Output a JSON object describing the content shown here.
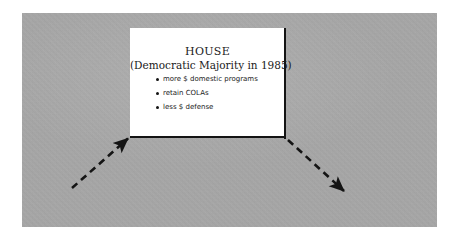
{
  "figure": {
    "panel_background_color": "#a9a9a9",
    "wall_background_color": "#ffffff",
    "line_color": "#141414",
    "text_color": "#1a1a1a"
  },
  "wall": {
    "title": "HOUSE",
    "subtitle": "(Democratic Majority in 1985)",
    "bullets": [
      {
        "text": "more $ domestic programs"
      },
      {
        "text": "retain COLAs"
      },
      {
        "text": "less $ defense"
      }
    ]
  },
  "connectors": [
    {
      "name": "left-dashed-arrow",
      "direction": "up-right",
      "arrowhead_at": "end",
      "start": {
        "x": 72,
        "y": 188
      },
      "end": {
        "x": 130,
        "y": 137
      }
    },
    {
      "name": "right-dashed-arrow",
      "direction": "down-right",
      "arrowhead_at": "end",
      "start": {
        "x": 287,
        "y": 139
      },
      "end": {
        "x": 345,
        "y": 192
      }
    }
  ]
}
